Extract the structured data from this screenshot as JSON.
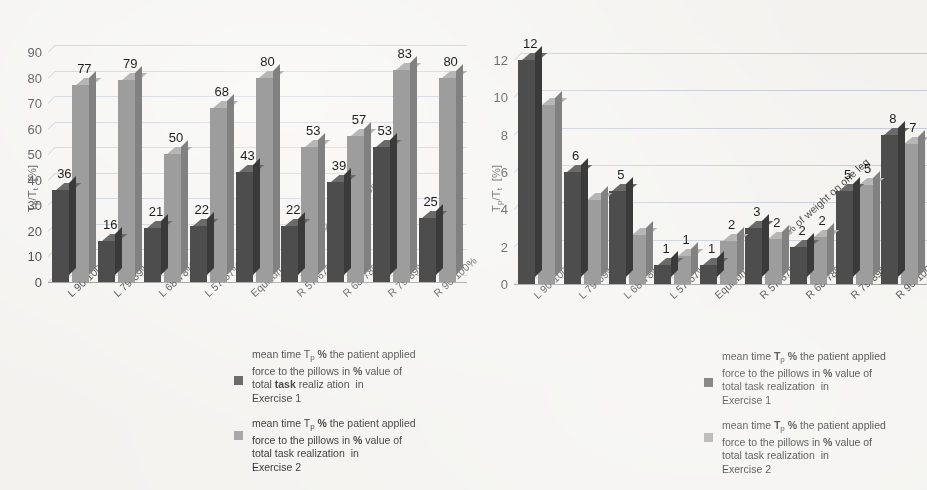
{
  "charts": [
    {
      "id": "left",
      "y_axis_title_main": "T",
      "y_axis_title_sub": "p",
      "y_axis_title_rest": "/T",
      "y_axis_title_sub2": "t",
      "y_axis_title_unit": "[%]",
      "y_axis_title_full": "Tp/Tt  [%]",
      "yticks": [
        "0",
        "10",
        "20",
        "30",
        "40",
        "50",
        "60",
        "70",
        "80",
        "90"
      ],
      "categories": [
        "L 90-100%",
        "L 79-89%",
        "L 68-78%",
        "L 57-67%",
        "Equilibrum: up to 56% of weight on one leg",
        "R 57-67%",
        "R 68-78%",
        "R 79-89%",
        "R 90-100%"
      ],
      "series1_values": [
        36,
        16,
        21,
        22,
        43,
        22,
        39,
        53,
        25
      ],
      "series2_values": [
        77,
        79,
        50,
        68,
        80,
        53,
        57,
        83,
        80
      ],
      "series1_labels": [
        "36",
        "16",
        "21",
        "22",
        "43",
        "22",
        "39",
        "53",
        "25"
      ],
      "series2_labels": [
        "77",
        "79",
        "50",
        "68",
        "80",
        "53",
        "57",
        "83",
        "80"
      ],
      "legend": [
        {
          "lines": [
            "mean time Tp % the patient applied",
            "force to the pillows in % value of",
            "total task realization in",
            "Exercise 1"
          ],
          "color": "#4d4d4d"
        },
        {
          "lines": [
            "mean time Tp % the patient applied",
            "force to the pillows in % value of",
            "total task realization in",
            "Exercise 2"
          ],
          "color": "#a0a0a0"
        }
      ]
    },
    {
      "id": "right",
      "y_axis_title_full": "Tp/Tt  [%]",
      "yticks": [
        "0",
        "2",
        "4",
        "6",
        "8",
        "10",
        "12"
      ],
      "categories": [
        "L 90-100%",
        "L 79-89%",
        "L 68-78%",
        "L 57-67%",
        "Equilibrum: up to 56% of weight on one leg",
        "R 57-67%",
        "R 68-78%",
        "R 79-89%",
        "R 90-100%"
      ],
      "series1_values": [
        12,
        6,
        5,
        1,
        1,
        3,
        2,
        5,
        8
      ],
      "series2_values": [
        9.6,
        4.5,
        2.6,
        1.5,
        2.3,
        2.4,
        2.5,
        5.3,
        7.5
      ],
      "series1_labels": [
        "12",
        "6",
        "5",
        "1",
        "1",
        "3",
        "2",
        "5",
        "8"
      ],
      "series2_labels": [
        "",
        "",
        "",
        "1",
        "2",
        "2",
        "2",
        "5",
        "7"
      ],
      "legend": [
        {
          "lines": [
            "mean time Tp % the patient applied",
            "force to the pillows in % value of",
            "total task realization in",
            "Exercise 1"
          ],
          "color": "#4d4d4d"
        },
        {
          "lines": [
            "mean time Tp % the patient applied",
            "force to the pillows in % value of",
            "total task realization in",
            "Exercise 2"
          ],
          "color": "#a0a0a0"
        }
      ]
    }
  ],
  "chart_data": [
    {
      "type": "bar",
      "title": "",
      "subtitle": "",
      "xlabel": "",
      "ylabel": "Tp/Tt [%]",
      "ylim": [
        0,
        90
      ],
      "ytick_step": 10,
      "grid": true,
      "legend_position": "below-right",
      "three_d": true,
      "categories": [
        "L 90-100%",
        "L 79-89%",
        "L 68-78%",
        "L 57-67%",
        "Equilibrum: up to 56% of weight on one leg",
        "R 57-67%",
        "R 68-78%",
        "R 79-89%",
        "R 90-100%"
      ],
      "series": [
        {
          "name": "mean time Tp % the patient applied force to the pillows in % value of total task realization in Exercise 1",
          "color": "#4d4d4d",
          "values": [
            36,
            16,
            21,
            22,
            43,
            22,
            39,
            53,
            25
          ]
        },
        {
          "name": "mean time Tp % the patient applied force to the pillows in % value of total task realization in Exercise 2",
          "color": "#a0a0a0",
          "values": [
            77,
            79,
            50,
            68,
            80,
            53,
            57,
            83,
            80
          ]
        }
      ]
    },
    {
      "type": "bar",
      "title": "",
      "subtitle": "",
      "xlabel": "",
      "ylabel": "Tp/Tt [%]",
      "ylim": [
        0,
        12
      ],
      "ytick_step": 2,
      "grid": true,
      "legend_position": "below-right",
      "three_d": true,
      "categories": [
        "L 90-100%",
        "L 79-89%",
        "L 68-78%",
        "L 57-67%",
        "Equilibrum: up to 56% of weight on one leg",
        "R 57-67%",
        "R 68-78%",
        "R 79-89%",
        "R 90-100%"
      ],
      "series": [
        {
          "name": "mean time Tp % the patient applied force to the pillows in % value of total task realization in Exercise 1",
          "color": "#4d4d4d",
          "values": [
            12,
            6,
            5,
            1,
            1,
            3,
            2,
            5,
            8
          ]
        },
        {
          "name": "mean time Tp % the patient applied force to the pillows in % value of total task realization in Exercise 2",
          "color": "#a0a0a0",
          "values": [
            9.6,
            4.5,
            2.6,
            1.5,
            2.3,
            2.4,
            2.5,
            5.3,
            7.5
          ],
          "data_labels": [
            "",
            "",
            "",
            "1",
            "2",
            "2",
            "2",
            "5",
            "7"
          ]
        }
      ]
    }
  ]
}
